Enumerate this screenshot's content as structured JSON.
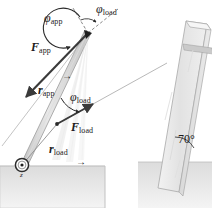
{
  "figure": {
    "background_color": "#ffffff",
    "ground_color": "#e6e6e6",
    "slab_color": "#ebebeb",
    "lever_color": "#cfcfcf",
    "vector_color": "#3a3a3a"
  },
  "labels": {
    "phi_app": {
      "symbol": "φ",
      "subscript": "app"
    },
    "phi_load_top": {
      "symbol": "φ",
      "subscript": "load"
    },
    "phi_load_mid": {
      "symbol": "φ",
      "subscript": "load"
    },
    "F_app": {
      "arrow": "→",
      "symbol": "F",
      "subscript": "app"
    },
    "r_app": {
      "arrow": "→",
      "symbol": "r",
      "subscript": "app"
    },
    "F_load": {
      "arrow": "→",
      "symbol": "F",
      "subscript": "load"
    },
    "r_load": {
      "arrow": "→",
      "symbol": "r",
      "subscript": "load"
    },
    "pivot_axis": {
      "symbol": "z"
    },
    "slab_angle": {
      "value": "70°"
    }
  },
  "geometry": {
    "pivot": {
      "x": 22,
      "y": 165
    },
    "lever_tip": {
      "x": 88,
      "y": 33
    },
    "load_point": {
      "x": 57,
      "y": 124
    },
    "slab_angle_degrees": 70
  }
}
